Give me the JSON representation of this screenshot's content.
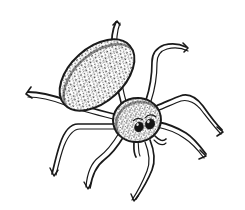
{
  "image": {
    "title": "Spider line illustration",
    "subject": "spider",
    "style": "pen-and-ink stipple line drawing",
    "width": 245,
    "height": 210,
    "background_color": "#ffffff",
    "ink_color": "#1a1a1a",
    "stipple_color": "#3a3a3a"
  },
  "anatomy": {
    "abdomen": {
      "name": "abdomen",
      "shape": "ellipse",
      "center_x": 97,
      "center_y": 75,
      "radius_x": 44,
      "radius_y": 27,
      "rotation_deg": -42,
      "fill": "stippled",
      "outline_color": "#1a1a1a"
    },
    "cephalothorax": {
      "name": "cephalothorax",
      "shape": "ellipse",
      "center_x": 137,
      "center_y": 120,
      "radius_x": 24,
      "radius_y": 22,
      "rotation_deg": -10,
      "fill": "stippled",
      "outline_color": "#1a1a1a"
    },
    "eyes": [
      {
        "name": "eye-left",
        "cx": 139,
        "cy": 127,
        "rx": 4.2,
        "ry": 5.0,
        "rotation_deg": 25,
        "color": "#141414"
      },
      {
        "name": "eye-right",
        "cx": 150,
        "cy": 124,
        "rx": 4.6,
        "ry": 5.2,
        "rotation_deg": 30,
        "color": "#141414"
      }
    ],
    "pedipalps": [
      {
        "name": "pedipalp-left",
        "path": "M 134 141 C 134 148, 133 152, 136 157"
      },
      {
        "name": "pedipalp-right",
        "path": "M 155 136 C 160 141, 163 142, 166 139"
      }
    ],
    "legs": [
      {
        "name": "leg-front-left",
        "side": "left",
        "index": 1,
        "segments": "M 122 106 C 118 92, 114 70, 112 52 C 111 40, 112 30, 116 22",
        "tip_x": 116,
        "tip_y": 22
      },
      {
        "name": "leg-front-right",
        "side": "right",
        "index": 2,
        "segments": "M 146 100 C 150 88, 152 74, 152 62 C 152 54, 156 48, 164 45 C 172 43, 180 44, 186 47",
        "tip_x": 186,
        "tip_y": 47
      },
      {
        "name": "leg-second-right",
        "side": "right",
        "index": 3,
        "segments": "M 156 106 C 166 102, 174 98, 180 96 C 188 93, 196 97, 203 106 C 210 116, 216 124, 222 130",
        "tip_x": 222,
        "tip_y": 130
      },
      {
        "name": "leg-third-right",
        "side": "right",
        "index": 4,
        "segments": "M 158 122 C 168 124, 178 128, 186 133 C 194 138, 200 146, 206 154",
        "tip_x": 206,
        "tip_y": 154
      },
      {
        "name": "leg-rear-right",
        "side": "right",
        "index": 5,
        "segments": "M 150 140 C 154 150, 156 160, 152 170 C 148 180, 142 190, 136 199",
        "tip_x": 136,
        "tip_y": 199
      },
      {
        "name": "leg-rear-left",
        "side": "left",
        "index": 6,
        "segments": "M 124 136 C 118 146, 112 154, 104 160 C 96 166, 92 176, 90 188",
        "tip_x": 90,
        "tip_y": 188
      },
      {
        "name": "leg-third-left",
        "side": "left",
        "index": 7,
        "segments": "M 114 124 C 100 124, 88 124, 78 124 C 70 124, 64 132, 60 144 C 56 156, 54 166, 52 174",
        "tip_x": 52,
        "tip_y": 174
      },
      {
        "name": "leg-second-left",
        "side": "left",
        "index": 8,
        "segments": "M 114 114 C 98 110, 82 106, 66 100 C 52 95, 40 92, 28 92",
        "tip_x": 28,
        "tip_y": 92
      }
    ]
  }
}
